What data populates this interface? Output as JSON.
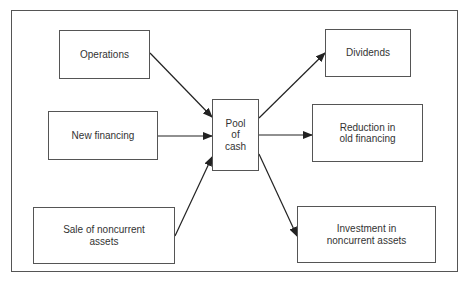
{
  "diagram": {
    "title": "",
    "sources": [
      {
        "id": "operations",
        "label": "Operations"
      },
      {
        "id": "new-financing",
        "label": "New financing"
      },
      {
        "id": "sale-noncurrent",
        "label": "Sale of noncurrent\nassets"
      }
    ],
    "center": {
      "id": "pool",
      "label": "Pool\nof\ncash"
    },
    "uses": [
      {
        "id": "dividends",
        "label": "Dividends"
      },
      {
        "id": "reduction",
        "label": "Reduction in\nold financing"
      },
      {
        "id": "investment",
        "label": "Investment in\nnoncurrent assets"
      }
    ],
    "edges": [
      {
        "from": "operations",
        "to": "pool"
      },
      {
        "from": "new-financing",
        "to": "pool"
      },
      {
        "from": "sale-noncurrent",
        "to": "pool"
      },
      {
        "from": "pool",
        "to": "dividends"
      },
      {
        "from": "pool",
        "to": "reduction"
      },
      {
        "from": "pool",
        "to": "investment"
      }
    ]
  }
}
